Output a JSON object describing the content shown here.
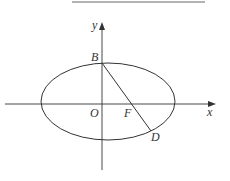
{
  "diagram": {
    "type": "ellipse-coordinate-figure",
    "axes": {
      "x_label": "x",
      "y_label": "y",
      "origin_label": "O"
    },
    "points": {
      "B": "B",
      "F": "F",
      "D": "D"
    },
    "colors": {
      "stroke": "#333333",
      "top_rule": "#9a9a9a"
    }
  }
}
